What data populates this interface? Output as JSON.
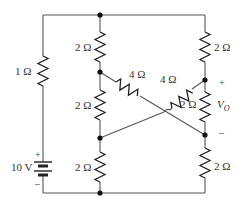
{
  "diagram": {
    "type": "circuit-schematic",
    "source": {
      "label": "10 V",
      "plus": "+",
      "minus": "–"
    },
    "resistors": [
      {
        "id": "r-left-series",
        "label": "1 Ω"
      },
      {
        "id": "r-mid-top",
        "label": "2 Ω"
      },
      {
        "id": "r-mid-middle",
        "label": "2 Ω"
      },
      {
        "id": "r-mid-bottom",
        "label": "2 Ω"
      },
      {
        "id": "r-right-top",
        "label": "2 Ω"
      },
      {
        "id": "r-right-middle",
        "label": "2 Ω"
      },
      {
        "id": "r-right-bottom",
        "label": "2 Ω"
      },
      {
        "id": "r-diag-left",
        "label": "4 Ω"
      },
      {
        "id": "r-diag-right",
        "label": "4 Ω"
      }
    ],
    "output": {
      "label": "V",
      "subscript": "O",
      "plus": "+",
      "minus": "–"
    }
  }
}
